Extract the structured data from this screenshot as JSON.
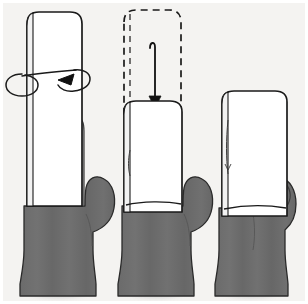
{
  "meta": {
    "panel_count": 3
  },
  "colors": {
    "background": "#f4f3f1",
    "frame": "#ffffff",
    "ink": "#1a1a1a",
    "hand_fill": "#6b6b6b",
    "finger_fill": "#b8b8b8",
    "phone_fill": "#ffffff",
    "phone_edge_fill": "#f2f2f2",
    "shadow": "#cfcfcf"
  },
  "panels": [
    {
      "id": "panel-1",
      "index": 1,
      "caption": "Phone held upright against fingers, rotation indicated",
      "phone": {
        "state": "upright-high",
        "style": "solid-outline",
        "fill": "#ffffff"
      },
      "hand": {
        "pose": "open-palm-behind",
        "fingers_visible": true,
        "finger_count": 4,
        "thumb_position": "right-extended"
      },
      "annotation": {
        "kind": "rotation-arrow",
        "label": "rotate",
        "direction": "counter-clockwise",
        "shape": "ellipse-with-arrowhead"
      }
    },
    {
      "id": "panel-2",
      "index": 2,
      "caption": "Phone slides down into the palm",
      "phone": {
        "state": "lowered",
        "style": "solid-outline",
        "fill": "#ffffff"
      },
      "ghost_phone": {
        "state": "previous-position",
        "style": "dashed-outline",
        "label": "former position"
      },
      "hand": {
        "pose": "cupped-palm",
        "fingers_visible": false,
        "finger_count": 0,
        "thumb_position": "right-extended"
      },
      "annotation": {
        "kind": "translate-arrow",
        "label": "slide down",
        "direction": "down",
        "shape": "straight-arrow-with-hook"
      }
    },
    {
      "id": "panel-3",
      "index": 3,
      "caption": "Phone gripped from the side with thumb wrapped",
      "phone": {
        "state": "gripped",
        "style": "solid-outline",
        "fill": "#ffffff"
      },
      "hand": {
        "pose": "side-grip",
        "fingers_visible": false,
        "finger_count": 0,
        "thumb_position": "curled-right-side"
      },
      "annotation": null
    }
  ]
}
